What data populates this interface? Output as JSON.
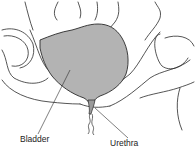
{
  "figure": {
    "labels": {
      "bladder": "Bladder",
      "urethra": "Urethra"
    },
    "colors": {
      "bladder_fill": "#b3b3b3",
      "outline": "#2a2a2a"
    }
  }
}
